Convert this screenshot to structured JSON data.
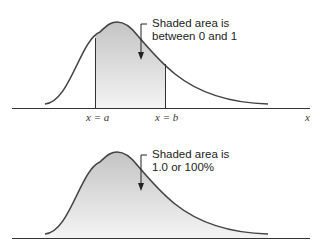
{
  "top_panel": {
    "annotation_line1": "Shaded area is",
    "annotation_line2": "between 0 and 1",
    "label_a": "x = a",
    "label_b": "x = b",
    "axis_label": "x"
  },
  "bottom_panel": {
    "annotation_line1": "Shaded area is",
    "annotation_line2": "1.0 or 100%"
  },
  "colors": {
    "curve": "#444444",
    "axis": "#333333",
    "shade_top": "#c8c8c8",
    "shade_bottom": "#f2f2f2"
  }
}
